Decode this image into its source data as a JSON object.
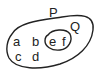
{
  "diagram": {
    "type": "venn",
    "sets": [
      {
        "name": "P",
        "label": "P",
        "elements_outside_subset": [
          "a",
          "b",
          "c",
          "d"
        ]
      },
      {
        "name": "Q",
        "label": "Q",
        "subset_of": "P",
        "elements": [
          "e",
          "f"
        ]
      }
    ],
    "labels": {
      "P": "P",
      "Q": "Q",
      "a": "a",
      "b": "b",
      "c": "c",
      "d": "d",
      "e": "e",
      "f": "f"
    },
    "colors": {
      "stroke": "#222222",
      "background": "#ffffff"
    }
  }
}
